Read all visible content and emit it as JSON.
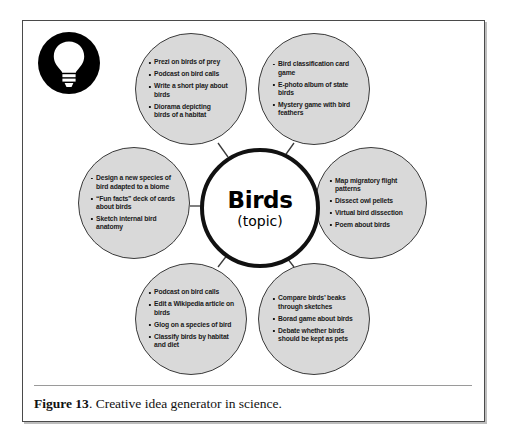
{
  "figure": {
    "caption_label": "Figure 13",
    "caption_text": ". Creative idea generator in science.",
    "icon": "lightbulb-icon"
  },
  "colors": {
    "node_fill": "#d9d9d9",
    "node_stroke": "#3a3a3a",
    "center_stroke": "#111111",
    "text": "#1a1a1a",
    "frame": "#4a4a4a"
  },
  "diagram": {
    "type": "hub-and-spoke idea map",
    "center": {
      "title": "Birds",
      "subtitle": "(topic)"
    },
    "nodes": [
      {
        "id": "top-left",
        "position": "top-left",
        "items": [
          "Prezi on birds of prey",
          "Podcast on bird calls",
          "Write a short play about birds",
          "Diorama depicting birds of a habitat"
        ]
      },
      {
        "id": "top-right",
        "position": "top-right",
        "items": [
          "Bird classification card game",
          "E-photo album of state birds",
          "Mystery game with bird feathers"
        ]
      },
      {
        "id": "left",
        "position": "left",
        "items": [
          "Design a new species of bird adapted to a biome",
          "“Fun facts” deck of cards about birds",
          "Sketch internal bird anatomy"
        ]
      },
      {
        "id": "right",
        "position": "right",
        "items": [
          "Map migratory flight patterns",
          "Dissect owl pellets",
          "Virtual bird dissection",
          "Poem about birds"
        ]
      },
      {
        "id": "bottom-left",
        "position": "bottom-left",
        "items": [
          "Podcast on bird calls",
          "Edit a Wikipedia article on birds",
          "Glog on a species of bird",
          "Classify birds by habitat and diet"
        ]
      },
      {
        "id": "bottom-right",
        "position": "bottom-right",
        "items": [
          "Compare birds’ beaks through sketches",
          "Borad game about birds",
          "Debate whether birds should be kept as pets"
        ]
      }
    ]
  }
}
